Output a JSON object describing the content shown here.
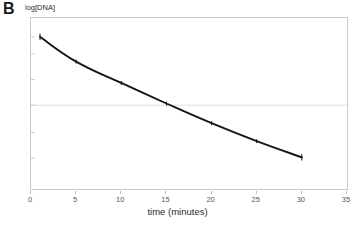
{
  "figure": {
    "panel_label": "B",
    "background_color": "#ffffff",
    "axis_color": "#c9c9c9",
    "gridline_color": "#dcdcdc",
    "curve_color": "#161616"
  },
  "chart_data": {
    "type": "line",
    "title": "",
    "subtitle": "",
    "xlabel": "time (minutes)",
    "ylabel": "log[DNA]",
    "xlim": [
      0,
      35
    ],
    "ylim": [
      0,
      1
    ],
    "xticks": [
      0,
      5,
      10,
      15,
      20,
      25,
      30,
      35
    ],
    "xticklabels": [
      "0",
      "5",
      "10",
      "15",
      "20",
      "25",
      "30",
      "35"
    ],
    "yticks": [
      0.18,
      0.33,
      0.49,
      0.64,
      0.79,
      0.89
    ],
    "yticklabels": [
      "",
      "",
      "",
      "",
      "",
      ""
    ],
    "grid": true,
    "gridlines_horizontal": [
      0.49
    ],
    "legend": false,
    "legend_position": "none",
    "series": [
      {
        "name": "log[DNA] decay",
        "marker": "tick",
        "x": [
          1,
          5,
          10,
          15,
          20,
          25,
          30
        ],
        "y": [
          0.89,
          0.745,
          0.62,
          0.5,
          0.385,
          0.28,
          0.185
        ]
      }
    ],
    "annotations": []
  },
  "axis": {
    "x_tick_labels": [
      {
        "value": 0,
        "label": "0"
      },
      {
        "value": 5,
        "label": "5"
      },
      {
        "value": 10,
        "label": "10"
      },
      {
        "value": 15,
        "label": "15"
      },
      {
        "value": 20,
        "label": "20"
      },
      {
        "value": 25,
        "label": "25"
      },
      {
        "value": 30,
        "label": "30"
      },
      {
        "value": 35,
        "label": "35"
      }
    ]
  }
}
